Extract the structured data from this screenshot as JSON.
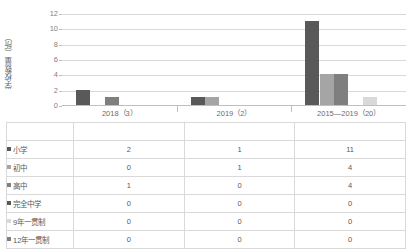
{
  "chart_data": {
    "type": "bar",
    "title": "",
    "xlabel": "",
    "ylabel": "学校数量（所）",
    "ylim": [
      0,
      12
    ],
    "yticks": [
      0,
      2,
      4,
      6,
      8,
      10,
      12
    ],
    "grid": true,
    "legend_position": "table",
    "categories": [
      "2018（3）",
      "2019（2）",
      "2015—2019（20）"
    ],
    "series": [
      {
        "name": "小学",
        "color": "#595959",
        "values": [
          2,
          1,
          11
        ]
      },
      {
        "name": "初中",
        "color": "#a5a5a5",
        "values": [
          0,
          1,
          4
        ]
      },
      {
        "name": "高中",
        "color": "#7f7f7f",
        "values": [
          1,
          0,
          4
        ]
      },
      {
        "name": "完全中学",
        "color": "#bfbfbf",
        "values": [
          0,
          0,
          0
        ]
      },
      {
        "name": "9年一贯制",
        "color": "#d9d9d9",
        "values": [
          0,
          0,
          1
        ]
      },
      {
        "name": "12年一贯制",
        "color": "#e8e8e8",
        "values": [
          0,
          0,
          0
        ]
      }
    ]
  },
  "table": {
    "column_headers": [
      "2018（3）",
      "2019（2）",
      "2015—2019（20）"
    ],
    "rows": [
      {
        "label": "小学",
        "marker_color": "#595959",
        "values": [
          "2",
          "1",
          "11"
        ]
      },
      {
        "label": "初中",
        "marker_color": "#a5a5a5",
        "values": [
          "0",
          "1",
          "4"
        ]
      },
      {
        "label": "高中",
        "marker_color": "#7f7f7f",
        "values": [
          "1",
          "0",
          "4"
        ]
      },
      {
        "label": "完全中学",
        "marker_color": "#595959",
        "values": [
          "0",
          "0",
          "0"
        ]
      },
      {
        "label": "9年一贯制",
        "marker_color": "#d9d9d9",
        "values": [
          "0",
          "0",
          "0"
        ]
      },
      {
        "label": "12年一贯制",
        "marker_color": "#7f7f7f",
        "values": [
          "0",
          "0",
          "0"
        ]
      }
    ]
  },
  "colors": {
    "gridline": "#d9d9d9",
    "axis": "#bfbfbf",
    "text": "#595959",
    "tick_text": "#7f7f7f"
  }
}
